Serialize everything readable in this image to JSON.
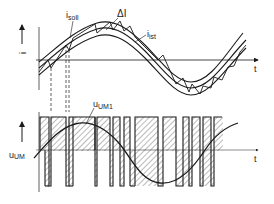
{
  "diagram": {
    "type": "hysteresis-current-control-waveforms",
    "top_plot": {
      "y_axis_label": "i",
      "x_axis_label": "t",
      "labels": {
        "reference": "i",
        "reference_sub": "soll",
        "actual": "i",
        "actual_sub": "ist",
        "band": "ΔI"
      }
    },
    "bottom_plot": {
      "y_axis_label": "u",
      "y_axis_label_sub": "UM",
      "x_axis_label": "t",
      "labels": {
        "fundamental": "u",
        "fundamental_sub": "UM1"
      },
      "pulses": [
        {
          "x1": 40,
          "x2": 49
        },
        {
          "x1": 51,
          "x2": 66
        },
        {
          "x1": 69,
          "x2": 73
        },
        {
          "x1": 73,
          "x2": 95
        },
        {
          "x1": 97,
          "x2": 110
        },
        {
          "x1": 113,
          "x2": 120
        },
        {
          "x1": 124,
          "x2": 130
        },
        {
          "x1": 135,
          "x2": 158
        },
        {
          "x1": 163,
          "x2": 176
        },
        {
          "x1": 183,
          "x2": 189
        },
        {
          "x1": 192,
          "x2": 200
        },
        {
          "x1": 203,
          "x2": 211
        },
        {
          "x1": 214,
          "x2": 222
        }
      ]
    },
    "colors": {
      "line": "#1a1a1a",
      "hatch": "#333333",
      "background": "#ffffff"
    }
  }
}
